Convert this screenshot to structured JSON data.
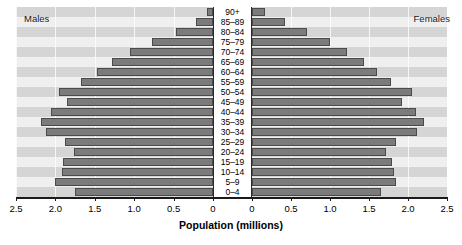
{
  "captions": {
    "left": "Males",
    "right": "Females"
  },
  "axis": {
    "title": "Population (millions)",
    "left_ticks": [
      "2.5",
      "2.0",
      "1.5",
      "1.0",
      "0.5",
      "0"
    ],
    "right_ticks": [
      "0",
      "0.5",
      "1.0",
      "1.5",
      "2.0",
      "2.5"
    ],
    "max": 2.5,
    "grid": true
  },
  "colors": {
    "bar_fill": "#7b7b7b",
    "bar_stroke": "#4a4a4a",
    "band_dark": "#d5d5d5",
    "band_light": "#efefef",
    "axis": "#1a1a1a",
    "text": "#000000",
    "background": "#ffffff"
  },
  "chart_data": {
    "type": "bar",
    "subtype": "population-pyramid",
    "title": "",
    "xlabel": "Population (millions)",
    "ylabel": "",
    "xlim": [
      0,
      2.5
    ],
    "grid": true,
    "legend_position": "inside-top-corners",
    "categories": [
      "90+",
      "85–89",
      "80–84",
      "75–79",
      "70–74",
      "65–69",
      "60–64",
      "55–59",
      "50–54",
      "45–49",
      "40–44",
      "35–39",
      "30–34",
      "25–29",
      "20–24",
      "15–19",
      "10–14",
      "5–9",
      "0–4"
    ],
    "series": [
      {
        "name": "Males",
        "side": "left",
        "values": [
          0.07,
          0.22,
          0.47,
          0.78,
          1.05,
          1.28,
          1.47,
          1.67,
          1.95,
          1.85,
          2.05,
          2.18,
          2.12,
          1.88,
          1.77,
          1.9,
          1.92,
          2.0,
          1.75
        ]
      },
      {
        "name": "Females",
        "side": "right",
        "values": [
          0.17,
          0.42,
          0.7,
          1.0,
          1.22,
          1.43,
          1.6,
          1.78,
          2.05,
          1.92,
          2.1,
          2.2,
          2.12,
          1.85,
          1.72,
          1.8,
          1.82,
          1.85,
          1.66
        ]
      }
    ]
  }
}
